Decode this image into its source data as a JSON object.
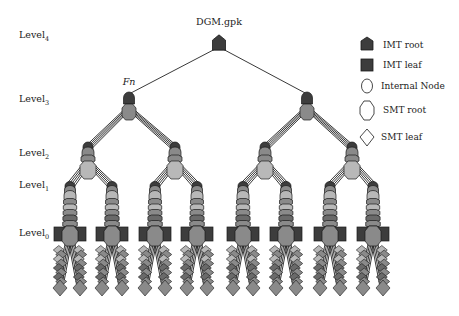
{
  "diagram": {
    "root_label": "DGM.gpk",
    "fn_label": "Fn",
    "levels": [
      {
        "base": "Level",
        "sub": "4"
      },
      {
        "base": "Level",
        "sub": "3"
      },
      {
        "base": "Level",
        "sub": "2"
      },
      {
        "base": "Level",
        "sub": "1"
      },
      {
        "base": "Level",
        "sub": "0"
      }
    ],
    "legend": [
      {
        "shape": "imt-root",
        "label": "IMT root"
      },
      {
        "shape": "imt-leaf",
        "label": "IMT leaf"
      },
      {
        "shape": "internal-node",
        "label": "Internal Node"
      },
      {
        "shape": "smt-root",
        "label": "SMT root"
      },
      {
        "shape": "smt-leaf",
        "label": "SMT leaf"
      }
    ],
    "colors": {
      "imt": "#3d3d3d",
      "smt_light": "#b8b8b8",
      "smt_mid": "#8a8a8a",
      "smt_dark": "#6a6a6a",
      "edge": "#222222",
      "outline": "#1a1a1a"
    },
    "tree": {
      "fanout_level3": 2,
      "fanout_level2": 2,
      "fanout_level1": 2,
      "leaf_columns_per_level0": 2
    }
  }
}
